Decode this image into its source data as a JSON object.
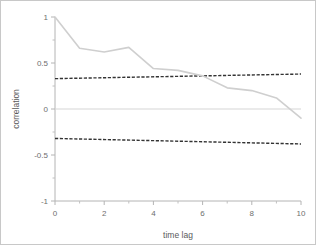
{
  "chart_data": {
    "type": "line",
    "title": "",
    "subtitle": "",
    "xlabel": "time lag",
    "ylabel": "correlation",
    "xlim": [
      0,
      10
    ],
    "ylim": [
      -1,
      1
    ],
    "xticks": [
      0,
      2,
      4,
      6,
      8,
      10
    ],
    "xtick_labels": [
      "0",
      "2",
      "4",
      "6",
      "8",
      "10"
    ],
    "xminor_ticks": [
      1,
      3,
      5,
      7,
      9
    ],
    "yticks": [
      -1,
      -0.5,
      0,
      0.5,
      1
    ],
    "ytick_labels": [
      "-1",
      "-0.5",
      "0",
      "0.5",
      "1"
    ],
    "yminor_ticks": [
      -0.75,
      -0.25,
      0.25,
      0.75
    ],
    "grid": false,
    "legend": null,
    "series": [
      {
        "name": "correlation",
        "style": "solid",
        "color": "#cfcfcf",
        "x": [
          0,
          1,
          2,
          3,
          4,
          5,
          6,
          7,
          8,
          9,
          10
        ],
        "values": [
          1.0,
          0.66,
          0.62,
          0.67,
          0.44,
          0.42,
          0.36,
          0.23,
          0.2,
          0.12,
          -0.1
        ]
      },
      {
        "name": "upper confidence bound",
        "style": "dashed",
        "color": "#333333",
        "x": [
          0,
          10
        ],
        "values": [
          0.33,
          0.38
        ]
      },
      {
        "name": "lower confidence bound",
        "style": "dashed",
        "color": "#333333",
        "x": [
          0,
          10
        ],
        "values": [
          -0.32,
          -0.38
        ]
      },
      {
        "name": "zero reference",
        "style": "solid",
        "color": "#d6d6d6",
        "x": [
          0,
          10
        ],
        "values": [
          0.0,
          0.0
        ]
      }
    ]
  },
  "axes": {
    "x_title": "time lag",
    "y_title": "correlation"
  }
}
